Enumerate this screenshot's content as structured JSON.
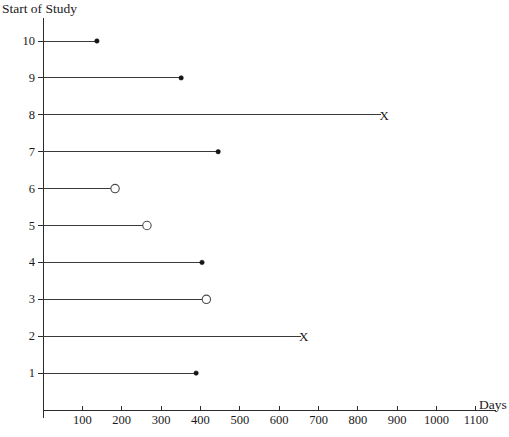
{
  "chart_data": {
    "type": "line",
    "title": "",
    "ylabel": "Start of Study",
    "xlabel": "Days",
    "xlim": [
      0,
      1150
    ],
    "ylim": [
      0,
      10.8
    ],
    "grid": false,
    "legend": "none",
    "xticks": [
      100,
      200,
      300,
      400,
      500,
      600,
      700,
      800,
      900,
      1000,
      1100
    ],
    "xtick_labels": [
      "100",
      "200",
      "300",
      "400",
      "500",
      "600",
      "700",
      "800",
      "900",
      "1000",
      "1100"
    ],
    "yticks": [
      1,
      2,
      3,
      4,
      5,
      6,
      7,
      8,
      9,
      10
    ],
    "ytick_labels": [
      "1",
      "2",
      "3",
      "4",
      "5",
      "6",
      "7",
      "8",
      "9",
      "10"
    ],
    "subject_lines": [
      {
        "subject": 10,
        "start": 0,
        "end": 137,
        "marker": "dot"
      },
      {
        "subject": 9,
        "start": 0,
        "end": 351,
        "marker": "dot"
      },
      {
        "subject": 8,
        "start": 0,
        "end": 859,
        "marker": "x"
      },
      {
        "subject": 7,
        "start": 0,
        "end": 445,
        "marker": "dot"
      },
      {
        "subject": 6,
        "start": 0,
        "end": 178,
        "marker": "circle"
      },
      {
        "subject": 5,
        "start": 0,
        "end": 259,
        "marker": "circle"
      },
      {
        "subject": 4,
        "start": 0,
        "end": 404,
        "marker": "dot"
      },
      {
        "subject": 3,
        "start": 0,
        "end": 410,
        "marker": "circle"
      },
      {
        "subject": 2,
        "start": 0,
        "end": 655,
        "marker": "x"
      },
      {
        "subject": 1,
        "start": 0,
        "end": 389,
        "marker": "dot"
      }
    ],
    "marker_glyphs": {
      "x": "X"
    },
    "colors": {
      "axis": "#2b2b2b",
      "line": "#3a3a3a",
      "dot_fill": "#151515",
      "circle_fill": "#ffffff",
      "circle_stroke": "#4a4a4a",
      "text": "#1a1a1a",
      "background": "#ffffff"
    }
  }
}
